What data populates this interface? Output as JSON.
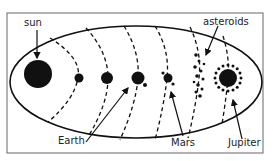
{
  "labels": {
    "sun": "sun",
    "asteroids": "asteroids",
    "earth": "Earth",
    "mars": "Mars",
    "jupiter": "Jupiter"
  },
  "bodies": [
    {
      "name": "sun",
      "kind": "star"
    },
    {
      "name": "mercury",
      "kind": "planet"
    },
    {
      "name": "venus",
      "kind": "planet"
    },
    {
      "name": "earth",
      "kind": "planet",
      "moons": 1
    },
    {
      "name": "mars",
      "kind": "planet",
      "moons": 2
    },
    {
      "name": "asteroid-belt",
      "kind": "asteroids"
    },
    {
      "name": "jupiter",
      "kind": "planet",
      "moons": "many"
    }
  ],
  "colors": {
    "ink": "#111111",
    "frame": "#555555",
    "background": "#ffffff"
  }
}
